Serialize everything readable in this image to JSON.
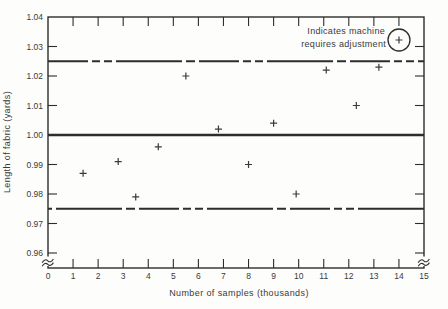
{
  "colors": {
    "background": "#fdfdfc",
    "ink": "#3a3a3a",
    "line": "#2d2d2d"
  },
  "chart_data": {
    "type": "scatter",
    "title": "",
    "xlabel": "Number of samples (thousands)",
    "ylabel": "Length of fabric (yards)",
    "xlim": [
      0,
      15
    ],
    "ylim": [
      0.96,
      1.04
    ],
    "grid": false,
    "x_ticks": [
      0,
      1,
      2,
      3,
      4,
      5,
      6,
      7,
      8,
      9,
      10,
      11,
      12,
      13,
      14,
      15
    ],
    "x_tick_labels": [
      "0",
      "1",
      "2",
      "3",
      "4",
      "5",
      "6",
      "7",
      "8",
      "9",
      "10",
      "11",
      "12",
      "13",
      "14",
      "15"
    ],
    "y_ticks": [
      0.96,
      0.97,
      0.98,
      0.99,
      1.0,
      1.01,
      1.02,
      1.03,
      1.04
    ],
    "y_tick_labels": [
      "0.96",
      "0.97",
      "0.98",
      "0.99",
      "1.00",
      "1.01",
      "1.02",
      "1.03",
      "1.04"
    ],
    "y_axis_break_below_min": true,
    "marker": "plus",
    "points": [
      {
        "x": 1.4,
        "y": 0.987
      },
      {
        "x": 2.8,
        "y": 0.991
      },
      {
        "x": 3.5,
        "y": 0.979
      },
      {
        "x": 4.4,
        "y": 0.996
      },
      {
        "x": 5.5,
        "y": 1.02
      },
      {
        "x": 6.8,
        "y": 1.002
      },
      {
        "x": 8.0,
        "y": 0.99
      },
      {
        "x": 9.0,
        "y": 1.004
      },
      {
        "x": 9.9,
        "y": 0.98
      },
      {
        "x": 11.1,
        "y": 1.022
      },
      {
        "x": 12.3,
        "y": 1.01
      },
      {
        "x": 13.2,
        "y": 1.023
      }
    ],
    "reference_lines": [
      {
        "name": "upper-control-limit",
        "value": 1.025,
        "style": "long-dash"
      },
      {
        "name": "center-line",
        "value": 1.0,
        "style": "solid"
      },
      {
        "name": "lower-control-limit",
        "value": 0.975,
        "style": "long-dash"
      }
    ],
    "legend": {
      "line1": "Indicates machine",
      "line2": "requires adjustment",
      "symbol": "circled-plus",
      "position": "top-right"
    }
  }
}
